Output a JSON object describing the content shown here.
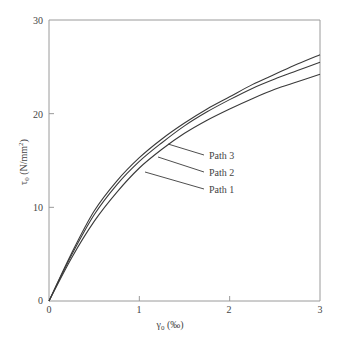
{
  "chart_data": {
    "type": "line",
    "title": "",
    "xlabel": "γ0 (‰)",
    "ylabel": "τ0 (N/mm²)",
    "xlim": [
      0,
      3
    ],
    "ylim": [
      0,
      30
    ],
    "x_ticks": [
      "0",
      "1",
      "2",
      "3"
    ],
    "y_ticks": [
      "0",
      "10",
      "20",
      "30"
    ],
    "grid": false,
    "legend_position": "inline-annotations",
    "x": [
      0,
      0.25,
      0.5,
      0.75,
      1.0,
      1.25,
      1.5,
      1.75,
      2.0,
      2.25,
      2.5,
      2.75,
      3.0
    ],
    "series": [
      {
        "name": "Path 1",
        "values": [
          0,
          4.6,
          8.5,
          11.6,
          14.2,
          16.2,
          17.9,
          19.3,
          20.5,
          21.6,
          22.6,
          23.4,
          24.2
        ]
      },
      {
        "name": "Path 2",
        "values": [
          0,
          4.9,
          9.2,
          12.4,
          14.9,
          16.9,
          18.7,
          20.2,
          21.5,
          22.7,
          23.7,
          24.6,
          25.5
        ]
      },
      {
        "name": "Path 3",
        "values": [
          0,
          5.1,
          9.6,
          12.8,
          15.3,
          17.3,
          19.0,
          20.5,
          21.8,
          23.1,
          24.2,
          25.3,
          26.3
        ]
      }
    ]
  },
  "axes": {
    "x_title_main": "γ",
    "x_title_sub": "0",
    "x_title_unit": " (‰)",
    "y_title_main": "τ",
    "y_title_sub": "0",
    "y_title_unit": " (N/mm",
    "y_title_sup": "2",
    "y_title_close": ")"
  },
  "legend": {
    "labels": [
      "Path 3",
      "Path 2",
      "Path 1"
    ]
  },
  "colors": {
    "axis": "#9a9a9a",
    "line": "#3a3a3a"
  }
}
